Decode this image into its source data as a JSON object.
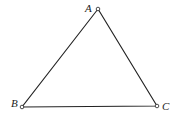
{
  "diagram": {
    "type": "triangle",
    "vertices": [
      {
        "label": "A",
        "x": 98,
        "y": 9,
        "label_x": 85,
        "label_y": 12
      },
      {
        "label": "B",
        "x": 22,
        "y": 107,
        "label_x": 11,
        "label_y": 107
      },
      {
        "label": "C",
        "x": 157,
        "y": 106,
        "label_x": 162,
        "label_y": 110
      }
    ],
    "stroke_color": "#222222",
    "background": "#ffffff"
  }
}
